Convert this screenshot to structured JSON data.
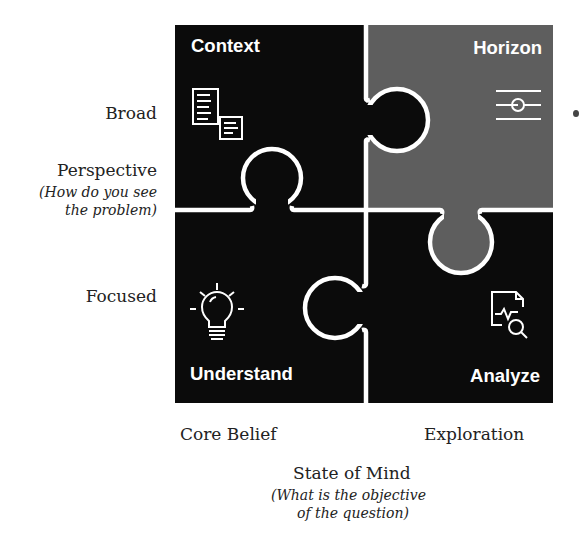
{
  "diagram": {
    "colors": {
      "dark_piece": "#0b0b0b",
      "gray_piece": "#5e5e5e",
      "outline": "#ffffff",
      "background": "#ffffff",
      "text": "#222222"
    },
    "pieces": [
      {
        "id": "top-left",
        "title": "Context",
        "icon": "documents-icon",
        "fill": "dark"
      },
      {
        "id": "top-right",
        "title": "Horizon",
        "icon": "slider-icon",
        "fill": "gray"
      },
      {
        "id": "bottom-left",
        "title": "Understand",
        "icon": "lightbulb-icon",
        "fill": "dark"
      },
      {
        "id": "bottom-right",
        "title": "Analyze",
        "icon": "document-analysis-icon",
        "fill": "dark"
      }
    ],
    "y_axis": {
      "top_label": "Broad",
      "bottom_label": "Focused",
      "title": "Perspective",
      "subtitle_line1": "(How do you see",
      "subtitle_line2": "the problem)"
    },
    "x_axis": {
      "left_label": "Core Belief",
      "right_label": "Exploration",
      "title": "State of Mind",
      "subtitle_line1": "(What is the objective",
      "subtitle_line2": "of the question)"
    }
  }
}
